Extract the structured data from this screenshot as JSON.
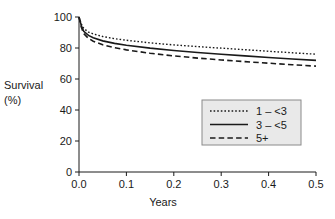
{
  "chart_data": {
    "type": "line",
    "title": "",
    "xlabel": "Years",
    "ylabel": "Survival (%)",
    "ylabel_line1": "Survival",
    "ylabel_line2": "(%)",
    "xlim": [
      0.0,
      0.5
    ],
    "ylim": [
      0,
      100
    ],
    "xticks": [
      "0.0",
      "0.1",
      "0.2",
      "0.3",
      "0.4",
      "0.5"
    ],
    "xtick_values": [
      0.0,
      0.1,
      0.2,
      0.3,
      0.4,
      0.5
    ],
    "yticks": [
      "0",
      "20",
      "40",
      "60",
      "80",
      "100"
    ],
    "ytick_values": [
      0,
      20,
      40,
      60,
      80,
      100
    ],
    "grid": false,
    "legend_position": "center-right",
    "x": [
      0.0,
      0.005,
      0.01,
      0.02,
      0.03,
      0.05,
      0.075,
      0.1,
      0.15,
      0.2,
      0.25,
      0.3,
      0.35,
      0.4,
      0.45,
      0.5
    ],
    "series": [
      {
        "name": "1 – <3",
        "style": "dotted",
        "color": "#1a1a1a",
        "values": [
          100.0,
          95.5,
          92.6,
          90.3,
          89.1,
          87.4,
          86.0,
          85.0,
          83.3,
          82.0,
          80.9,
          79.9,
          78.9,
          77.9,
          76.9,
          76.0
        ]
      },
      {
        "name": "3 – <5",
        "style": "solid",
        "color": "#1a1a1a",
        "values": [
          100.0,
          94.3,
          90.8,
          88.1,
          86.6,
          84.6,
          83.0,
          81.8,
          79.9,
          78.4,
          77.1,
          76.0,
          74.9,
          73.9,
          72.9,
          72.0
        ]
      },
      {
        "name": "5+",
        "style": "dashed",
        "color": "#1a1a1a",
        "values": [
          100.0,
          93.3,
          89.3,
          86.2,
          84.4,
          82.1,
          80.2,
          78.8,
          76.6,
          74.9,
          73.5,
          72.3,
          71.2,
          70.2,
          69.2,
          68.3
        ]
      }
    ],
    "legend": [
      {
        "label": "1 – <3",
        "style": "dotted"
      },
      {
        "label": "3 – <5",
        "style": "solid"
      },
      {
        "label": "5+",
        "style": "dashed"
      }
    ],
    "legend_bg_color": "#e9e9e9",
    "legend_border_color": "#8a8a8a",
    "axis_color": "#1a1a1a"
  }
}
